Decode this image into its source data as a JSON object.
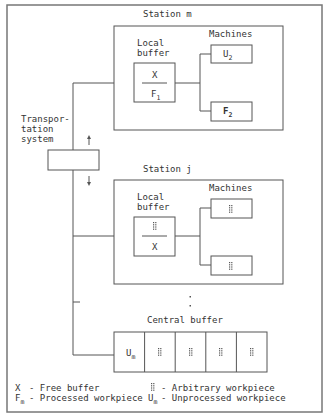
{
  "stations": {
    "m": {
      "title": "Station m",
      "local_buffer_label_1": "Local",
      "local_buffer_label_2": "buffer",
      "buffer_top": "X",
      "buffer_bottom_main": "F",
      "buffer_bottom_sub": "1",
      "machines_label": "Machines",
      "machine_1_main": "U",
      "machine_1_sub": "2",
      "machine_2_main": "F",
      "machine_2_sub": "2"
    },
    "j": {
      "title": "Station j",
      "local_buffer_label_1": "Local",
      "local_buffer_label_2": "buffer",
      "buffer_top": "arbitrary-workpiece",
      "buffer_bottom": "X",
      "machines_label": "Machines",
      "machine_1": "arbitrary-workpiece",
      "machine_2": "arbitrary-workpiece"
    }
  },
  "transport": {
    "line1": "Transpor-",
    "line2": "tation",
    "line3": "system",
    "arrow_up": "↑",
    "arrow_down": "↓"
  },
  "central_buffer": {
    "title": "Central buffer",
    "cell_1_main": "U",
    "cell_1_sub": "m",
    "cells": [
      "arbitrary-workpiece",
      "arbitrary-workpiece",
      "arbitrary-workpiece",
      "arbitrary-workpiece"
    ]
  },
  "legend": {
    "free_symbol": "X",
    "free_desc": "- Free buffer",
    "processed_main": "F",
    "processed_sub": "m",
    "processed_desc": "- Processed workpiece",
    "arbitrary_desc": "- Arbitrary workpiece",
    "unprocessed_main": "U",
    "unprocessed_sub": "m",
    "unprocessed_desc": "- Unprocessed workpiece"
  },
  "ellipsis": ":"
}
